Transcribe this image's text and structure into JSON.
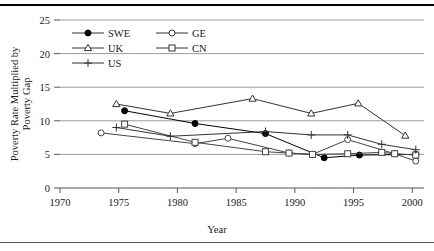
{
  "chart_data": {
    "type": "line",
    "title": "",
    "xlabel": "Year",
    "ylabel": "Poverty Rate Multiplied by\nPoverty Gap",
    "xlim": [
      1970,
      2001
    ],
    "ylim": [
      0,
      25
    ],
    "xticks": [
      1970,
      1975,
      1980,
      1985,
      1990,
      1995,
      2000
    ],
    "yticks": [
      0,
      5,
      10,
      15,
      20,
      25
    ],
    "grid": "horizontal",
    "legend_position": "top-left-inside",
    "series": [
      {
        "name": "SWE",
        "marker": "filled-circle",
        "color": "#000000",
        "points": [
          {
            "x": 1975.5,
            "y": 11.5
          },
          {
            "x": 1981.5,
            "y": 9.6
          },
          {
            "x": 1987.5,
            "y": 8.1
          },
          {
            "x": 1992.5,
            "y": 4.5
          },
          {
            "x": 1995.5,
            "y": 4.9
          },
          {
            "x": 2000.3,
            "y": 5.0
          }
        ]
      },
      {
        "name": "GE",
        "marker": "open-circle",
        "color": "#444444",
        "points": [
          {
            "x": 1973.5,
            "y": 8.2
          },
          {
            "x": 1981.5,
            "y": 6.6
          },
          {
            "x": 1984.3,
            "y": 7.4
          },
          {
            "x": 1989.5,
            "y": 5.2
          },
          {
            "x": 1991.5,
            "y": 5.0
          },
          {
            "x": 1994.5,
            "y": 7.2
          },
          {
            "x": 1998.5,
            "y": 5.1
          },
          {
            "x": 2000.3,
            "y": 4.0
          }
        ]
      },
      {
        "name": "UK",
        "marker": "open-triangle",
        "color": "#333333",
        "points": [
          {
            "x": 1974.8,
            "y": 12.5
          },
          {
            "x": 1979.4,
            "y": 11.1
          },
          {
            "x": 1986.4,
            "y": 13.3
          },
          {
            "x": 1991.4,
            "y": 11.1
          },
          {
            "x": 1995.4,
            "y": 12.6
          },
          {
            "x": 1999.4,
            "y": 7.8
          }
        ]
      },
      {
        "name": "CN",
        "marker": "open-square",
        "color": "#444444",
        "points": [
          {
            "x": 1975.5,
            "y": 9.5
          },
          {
            "x": 1981.5,
            "y": 6.8
          },
          {
            "x": 1987.5,
            "y": 5.4
          },
          {
            "x": 1989.5,
            "y": 5.2
          },
          {
            "x": 1991.5,
            "y": 5.0
          },
          {
            "x": 1994.5,
            "y": 5.1
          },
          {
            "x": 1997.4,
            "y": 5.3
          },
          {
            "x": 1998.5,
            "y": 5.1
          },
          {
            "x": 2000.3,
            "y": 4.9
          }
        ]
      },
      {
        "name": "US",
        "marker": "plus",
        "color": "#333333",
        "points": [
          {
            "x": 1974.8,
            "y": 9.0
          },
          {
            "x": 1979.4,
            "y": 7.7
          },
          {
            "x": 1987.5,
            "y": 8.4
          },
          {
            "x": 1991.4,
            "y": 7.9
          },
          {
            "x": 1994.5,
            "y": 7.9
          },
          {
            "x": 1997.4,
            "y": 6.5
          },
          {
            "x": 2000.3,
            "y": 5.7
          }
        ]
      }
    ],
    "legend_entries": [
      {
        "label": "SWE",
        "marker": "filled-circle"
      },
      {
        "label": "GE",
        "marker": "open-circle"
      },
      {
        "label": "UK",
        "marker": "open-triangle"
      },
      {
        "label": "CN",
        "marker": "open-square"
      },
      {
        "label": "US",
        "marker": "plus"
      }
    ]
  }
}
